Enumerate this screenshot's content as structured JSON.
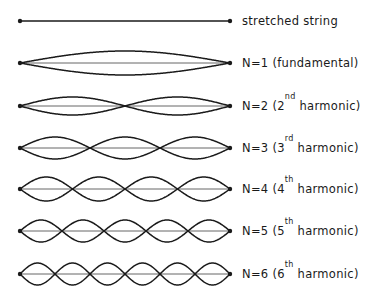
{
  "diagram": {
    "string": {
      "x_start": 20,
      "x_end": 230
    },
    "colors": {
      "line": "#1a1a1a",
      "centerline": "#555555",
      "background": "#ffffff"
    },
    "rows": [
      {
        "id": "stretched",
        "y": 21,
        "n": 0,
        "amplitude": 0,
        "label_main": "stretched string",
        "label_sup": "",
        "label_tail": ""
      },
      {
        "id": "n1",
        "y": 63,
        "n": 1,
        "amplitude": 12,
        "label_main": "N=1 (fundamental)",
        "label_sup": "",
        "label_tail": ""
      },
      {
        "id": "n2",
        "y": 106,
        "n": 2,
        "amplitude": 9,
        "label_main": "N=2 (2",
        "label_sup": "nd",
        "label_tail": " harmonic)"
      },
      {
        "id": "n3",
        "y": 148,
        "n": 3,
        "amplitude": 11,
        "label_main": "N=3 (3",
        "label_sup": "rd",
        "label_tail": " harmonic)"
      },
      {
        "id": "n4",
        "y": 189,
        "n": 4,
        "amplitude": 12,
        "label_main": "N=4 (4",
        "label_sup": "th",
        "label_tail": " harmonic)"
      },
      {
        "id": "n5",
        "y": 231,
        "n": 5,
        "amplitude": 11,
        "label_main": "N=5 (5",
        "label_sup": "th",
        "label_tail": " harmonic)"
      },
      {
        "id": "n6",
        "y": 274,
        "n": 6,
        "amplitude": 11,
        "label_main": "N=6 (6",
        "label_sup": "th",
        "label_tail": " harmonic)"
      }
    ]
  }
}
